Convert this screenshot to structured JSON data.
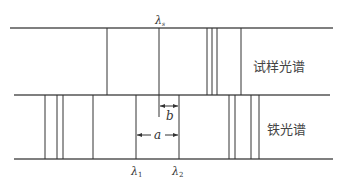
{
  "diagram": {
    "title": "",
    "labels": {
      "lambda_s": "λ",
      "lambda_s_sub": "s",
      "lambda_1": "λ",
      "lambda_1_sub": "1",
      "lambda_2": "λ",
      "lambda_2_sub": "2",
      "a": "a",
      "b": "b",
      "sample_spectrum": "试样光谱",
      "iron_spectrum": "铁光谱"
    },
    "sample_spectrum_lines_x": [
      107,
      159,
      207,
      212,
      217,
      241
    ],
    "iron_spectrum_lines_x": [
      45,
      57,
      63,
      93,
      136,
      179,
      229,
      235,
      251,
      259
    ],
    "colors": {
      "line": "#333333",
      "text": "#444444",
      "background": "#ffffff"
    }
  }
}
